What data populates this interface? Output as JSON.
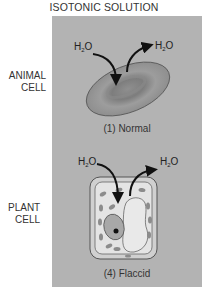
{
  "title": "ISOTONIC SOLUTION",
  "rows": [
    {
      "label_line1": "ANIMAL",
      "label_line2": "CELL",
      "caption": "(1) Normal",
      "water_in": "H",
      "water_out": "H",
      "water_sub": "2",
      "water_o": "O"
    },
    {
      "label_line1": "PLANT",
      "label_line2": "CELL",
      "caption": "(4) Flaccid",
      "water_in": "H",
      "water_out": "H",
      "water_sub": "2",
      "water_o": "O"
    }
  ],
  "colors": {
    "panel": "#b3b3b3",
    "cell_fill": "#9a9a9a",
    "arrow": "#111111",
    "plant_wall": "#d9d9d9",
    "vacuole": "#e6e6e6",
    "chloroplast": "#8c8c8c"
  }
}
